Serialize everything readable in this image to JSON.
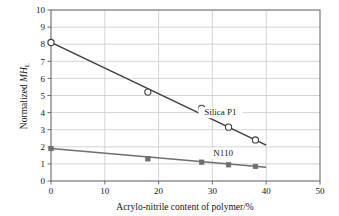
{
  "chart_data": {
    "type": "line",
    "title": "",
    "xlabel": "Acrylo-nitrile content of polymer/%",
    "ylabel_main": "Normalized ",
    "ylabel_italic": "MH",
    "ylabel_sub": "L",
    "ylabel_full": "Normalized MH_L",
    "xlim": [
      0,
      50
    ],
    "ylim": [
      0,
      10
    ],
    "xticks": [
      0,
      10,
      20,
      30,
      40,
      50
    ],
    "yticks": [
      0,
      1,
      2,
      3,
      4,
      5,
      6,
      7,
      8,
      9,
      10
    ],
    "xtick_labels": [
      "0",
      "10",
      "20",
      "30",
      "40",
      "50"
    ],
    "ytick_labels": [
      "0",
      "1",
      "2",
      "3",
      "4",
      "5",
      "6",
      "7",
      "8",
      "9",
      "10"
    ],
    "grid": true,
    "grid_color": "#c9c9c9",
    "axis_color": "#6b6b6b",
    "legend": "inline-annotations",
    "series": [
      {
        "name": "Silica P1",
        "marker": "open-circle",
        "color": "#3c3c3c",
        "label_x": 31.5,
        "label_y": 3.85,
        "trend_from": [
          0,
          8.1
        ],
        "trend_to": [
          40,
          2.1
        ],
        "x": [
          0,
          18,
          28,
          33,
          38
        ],
        "values": [
          8.1,
          5.2,
          4.25,
          3.15,
          2.4
        ]
      },
      {
        "name": "N110",
        "marker": "filled-square",
        "color": "#6e6e6e",
        "label_x": 32.0,
        "label_y": 1.45,
        "trend_from": [
          0,
          1.9
        ],
        "trend_to": [
          40,
          0.8
        ],
        "x": [
          0,
          18,
          28,
          33,
          38
        ],
        "values": [
          1.9,
          1.3,
          1.1,
          0.95,
          0.85
        ]
      }
    ]
  },
  "annotations": {
    "silica_label": "Silica P1",
    "n110_label": "N110"
  }
}
